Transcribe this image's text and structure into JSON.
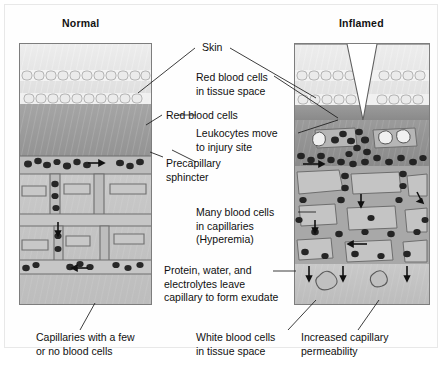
{
  "figure": {
    "type": "medical-illustration",
    "topic": "Comparison of normal skin microcirculation versus inflamed skin",
    "panels": [
      {
        "id": "normal",
        "title": "Normal"
      },
      {
        "id": "inflamed",
        "title": "Inflamed"
      }
    ]
  },
  "labels": {
    "skin": "Skin",
    "rbc_tissue": "Red blood cells\nin tissue space",
    "red_blood_cells": "Red blood cells",
    "leukocytes": "Leukocytes move\nto injury site",
    "precapillary": "Precapillary\nsphincter",
    "hyperemia": "Many blood cells\nin capillaries\n(Hyperemia)",
    "exudate": "Protein, water, and\nelectrolytes leave\ncapillary to form exudate",
    "few_cells": "Capillaries with a few\nor no blood cells",
    "wbc_tissue": "White blood cells\nin tissue space",
    "permeability": "Increased capillary\npermeability"
  },
  "colors": {
    "epidermis": "#e3e3e3",
    "epidermis_light": "#efefef",
    "dermis": "#9c9c9c",
    "subtissue": "#c4c4c4",
    "vessel": "#b4b4b4",
    "vessel_line": "#6e6e6e",
    "cell_dark": "#2b2b2b",
    "leader": "#1a1a1a",
    "frame": "#7d7d7d",
    "background": "#ffffff"
  }
}
